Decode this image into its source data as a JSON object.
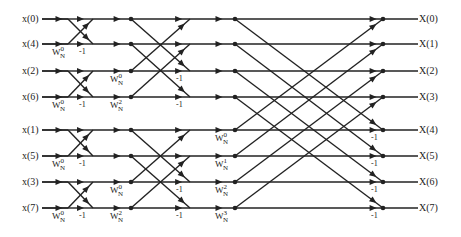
{
  "colors": {
    "line": "#222222",
    "background": "#ffffff"
  },
  "rows_y": [
    19,
    44,
    71,
    97,
    130,
    156,
    182,
    208
  ],
  "inputs": [
    "x(0)",
    "x(4)",
    "x(2)",
    "x(6)",
    "x(1)",
    "x(5)",
    "x(3)",
    "x(7)"
  ],
  "outputs": [
    "X(0)",
    "X(1)",
    "X(2)",
    "X(3)",
    "X(4)",
    "X(5)",
    "X(6)",
    "X(7)"
  ],
  "stages": [
    {
      "name": "stage-1",
      "x_start": 68,
      "x_end": 93,
      "span": 1,
      "twiddles": [
        {
          "row": 1,
          "base": "W",
          "sub": "N",
          "sup": "0"
        },
        {
          "row": 3,
          "base": "W",
          "sub": "N",
          "sup": "0"
        },
        {
          "row": 5,
          "base": "W",
          "sub": "N",
          "sup": "0"
        },
        {
          "row": 7,
          "base": "W",
          "sub": "N",
          "sup": "0"
        }
      ]
    },
    {
      "name": "stage-2",
      "x_start": 131,
      "x_end": 190,
      "span": 2,
      "twiddles": [
        {
          "row": 2,
          "base": "W",
          "sub": "N",
          "sup": "0"
        },
        {
          "row": 3,
          "base": "W",
          "sub": "N",
          "sup": "2"
        },
        {
          "row": 6,
          "base": "W",
          "sub": "N",
          "sup": "0"
        },
        {
          "row": 7,
          "base": "W",
          "sub": "N",
          "sup": "2"
        }
      ]
    },
    {
      "name": "stage-3",
      "x_start": 235,
      "x_end": 383,
      "span": 4,
      "twiddles": [
        {
          "row": 4,
          "base": "W",
          "sub": "N",
          "sup": "0"
        },
        {
          "row": 5,
          "base": "W",
          "sub": "N",
          "sup": "1"
        },
        {
          "row": 6,
          "base": "W",
          "sub": "N",
          "sup": "2"
        },
        {
          "row": 7,
          "base": "W",
          "sub": "N",
          "sup": "3"
        }
      ]
    }
  ],
  "minus_one_label": "-1"
}
